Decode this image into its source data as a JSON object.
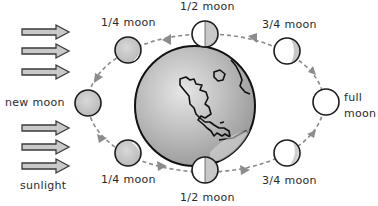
{
  "labels": {
    "sunlight": "sunlight",
    "new_moon": "new moon",
    "full_line1": "full",
    "full_line2": "moon",
    "quarter_top": "1/4 moon",
    "half_top": "1/2 moon",
    "three_quarter_top": "3/4 moon",
    "quarter_bottom": "1/4 moon",
    "half_bottom": "1/2 moon",
    "three_quarter_bottom": "3/4 moon"
  },
  "moons": [
    {
      "id": "new",
      "label": "new moon",
      "lit_fraction": 0
    },
    {
      "id": "quarter-top",
      "label": "1/4 moon",
      "lit_fraction": 0.25
    },
    {
      "id": "half-top",
      "label": "1/2 moon",
      "lit_fraction": 0.5
    },
    {
      "id": "three-quarter-top",
      "label": "3/4 moon",
      "lit_fraction": 0.75
    },
    {
      "id": "full",
      "label": "full moon",
      "lit_fraction": 1
    },
    {
      "id": "three-quarter-bottom",
      "label": "3/4 moon",
      "lit_fraction": 0.75
    },
    {
      "id": "half-bottom",
      "label": "1/2 moon",
      "lit_fraction": 0.5
    },
    {
      "id": "quarter-bottom",
      "label": "1/4 moon",
      "lit_fraction": 0.25
    }
  ],
  "center_body": "Earth",
  "orbit_direction": "counter-clockwise",
  "sunlight_arrow_count": 6,
  "colors": {
    "shadow": "#c8c8c8",
    "lit": "#ffffff",
    "outline": "#1c1c1c",
    "orbit": "#8a8a8a",
    "earth_fill": "#bdbdbd"
  }
}
